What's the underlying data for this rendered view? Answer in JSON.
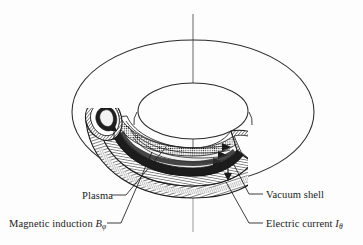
{
  "figure": {
    "type": "technical-diagram",
    "background_color": "#fdfdfd",
    "ink_color": "#1a1a1a",
    "axis": {
      "name": "vertical-symmetry-axis",
      "style": "thin solid line with faint dash-dot segment through torus hole",
      "x": 193,
      "y_top": 14,
      "y_bottom": 232
    },
    "geometry": {
      "outer_ellipse": {
        "cx": 193,
        "cy": 112,
        "rx": 121,
        "ry": 72
      },
      "inner_ellipse": {
        "cx": 193,
        "cy": 111,
        "rx": 55,
        "ry": 28
      },
      "cutaway_quadrant": "lower-left-front"
    }
  },
  "labels": {
    "plasma": "Plasma",
    "magnetic_induction_text": "Magnetic induction ",
    "magnetic_induction_symbol": "B",
    "magnetic_induction_subscript": "φ",
    "vacuum_shell": "Vacuum shell",
    "electric_current_text": "Electric current ",
    "electric_current_symbol": "I",
    "electric_current_subscript": "θ"
  },
  "leaders": [
    {
      "name": "plasma-leader",
      "from": [
        126,
        195
      ],
      "to": [
        166,
        147
      ]
    },
    {
      "name": "magnetic-leader",
      "from": [
        121,
        223
      ],
      "to": [
        152,
        152
      ]
    },
    {
      "name": "vacuum-leader",
      "from": [
        263,
        194
      ],
      "to": [
        233,
        163
      ]
    },
    {
      "name": "current-leader",
      "from": [
        263,
        223
      ],
      "to": [
        226,
        182
      ]
    }
  ],
  "annotations": {
    "field_arrows": "three toroidal arrowheads inside plasma channel pointing right",
    "current_arrows": "small arrows on vacuum shell indicating poloidal current"
  }
}
